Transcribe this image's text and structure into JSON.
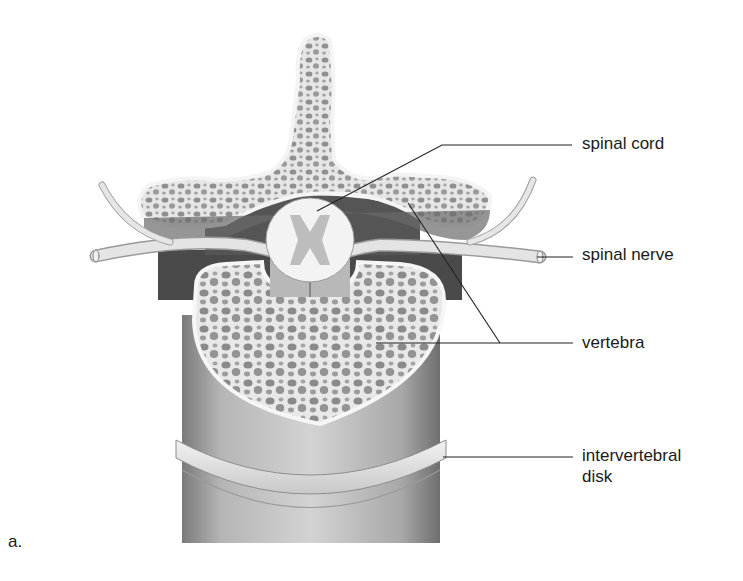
{
  "figure": {
    "panel_letter": "a.",
    "labels": [
      {
        "id": "spinal-cord",
        "text": "spinal cord"
      },
      {
        "id": "spinal-nerve",
        "text": "spinal nerve"
      },
      {
        "id": "vertebra",
        "text": "vertebra"
      },
      {
        "id": "intervertebral-disk",
        "line1": "intervertebral",
        "line2": "disk"
      }
    ]
  }
}
